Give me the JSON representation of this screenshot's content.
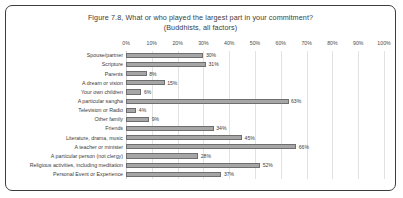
{
  "chart_data": {
    "type": "bar",
    "orientation": "horizontal",
    "title": "Figure 7.8, What or who played the largest part in your commitment?",
    "subtitle": "(Buddhists, all factors)",
    "xlabel": "",
    "ylabel": "",
    "xlim": [
      0,
      100
    ],
    "grid": true,
    "legend": "none",
    "value_suffix": "%",
    "tick_labels": [
      "0%",
      "10%",
      "20%",
      "30%",
      "40%",
      "50%",
      "60%",
      "70%",
      "80%",
      "90%",
      "100%"
    ],
    "tick_values": [
      0,
      10,
      20,
      30,
      40,
      50,
      60,
      70,
      80,
      90,
      100
    ],
    "categories": [
      "Spouse/partner",
      "Scripture",
      "Parents",
      "A dream or vision",
      "Your own children",
      "A particular sangha",
      "Television or Radio",
      "Other family",
      "Friends",
      "Literature, drama, music",
      "A teacher or minister",
      "A particular person (not clergy)",
      "Religious activities, including meditation",
      "Personal Event or Experience"
    ],
    "values": [
      30,
      31,
      8,
      15,
      6,
      63,
      4,
      9,
      34,
      45,
      66,
      28,
      52,
      37
    ],
    "value_labels": [
      "30%",
      "31%",
      "8%",
      "15%",
      "6%",
      "63%",
      "4%",
      "9%",
      "34%",
      "45%",
      "66%",
      "28%",
      "52%",
      "37%"
    ],
    "bar_color": "#a6a6a6",
    "bar_border_color": "#6e6e6e",
    "grid_color": "#e2e2e2",
    "text_color": "#3b3b3b",
    "frame_color": "#3d3d3d",
    "background": "#ffffff"
  }
}
